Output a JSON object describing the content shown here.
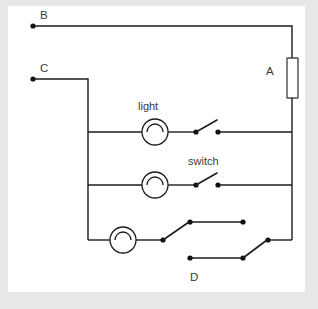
{
  "figure": {
    "background_color": "#e8e8e8",
    "panel_color": "#ffffff",
    "line_color": "#1c1c1c",
    "label_color": "#3a3a3a"
  },
  "labels": {
    "node_b": "B",
    "node_c": "C",
    "node_a": "A",
    "node_d": "D",
    "lamp_label": "light",
    "switch_label": "switch"
  },
  "components": {
    "resistor": {
      "name": "A",
      "symbol": "rectangle",
      "orientation": "vertical"
    },
    "lamps": [
      {
        "name": "light",
        "row": 1,
        "symbol": "circle-with-arc"
      },
      {
        "name": "light",
        "row": 2,
        "symbol": "circle-with-arc"
      },
      {
        "name": "light",
        "row": 3,
        "symbol": "circle-with-arc"
      }
    ],
    "switches": [
      {
        "name": "switch",
        "row": 1,
        "type": "single-pole",
        "state": "open"
      },
      {
        "name": "switch",
        "row": 2,
        "type": "single-pole",
        "state": "open"
      },
      {
        "name": "switch",
        "row": 3,
        "type": "two-way-changeover",
        "position": "left"
      },
      {
        "name": "switch",
        "row": 3,
        "type": "two-way-changeover",
        "position": "right"
      }
    ]
  },
  "terminals": [
    {
      "id": "B",
      "x": 33,
      "y": 26
    },
    {
      "id": "C",
      "x": 33,
      "y": 79
    }
  ]
}
